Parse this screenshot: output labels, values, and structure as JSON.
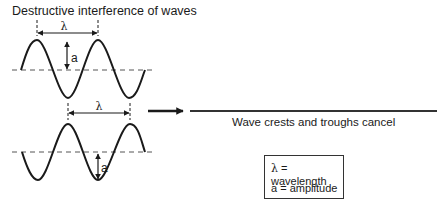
{
  "title": "Destructive interference of waves",
  "wave1": {
    "wavelength_label": "λ",
    "amplitude_label": "a"
  },
  "wave2": {
    "wavelength_label": "λ",
    "amplitude_label": "a"
  },
  "result": {
    "caption": "Wave crests and troughs cancel"
  },
  "legend": {
    "items": [
      {
        "symbol": "λ",
        "text": "= wavelength"
      },
      {
        "symbol": "a",
        "text": "= amplitude"
      }
    ]
  },
  "colors": {
    "stroke": "#1a1a1a",
    "dashed": "#555555"
  }
}
